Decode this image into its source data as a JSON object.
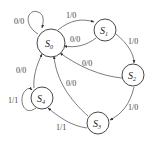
{
  "diagram": {
    "type": "state-machine",
    "states": [
      {
        "id": "S0",
        "name": "S",
        "sub": "0"
      },
      {
        "id": "S1",
        "name": "S",
        "sub": "1"
      },
      {
        "id": "S2",
        "name": "S",
        "sub": "2"
      },
      {
        "id": "S3",
        "name": "S",
        "sub": "3"
      },
      {
        "id": "S4",
        "name": "S",
        "sub": "4"
      }
    ],
    "transitions": [
      {
        "from": "S0",
        "to": "S0",
        "label": "0/0"
      },
      {
        "from": "S0",
        "to": "S1",
        "label": "1/0"
      },
      {
        "from": "S1",
        "to": "S0",
        "label": "0/0"
      },
      {
        "from": "S1",
        "to": "S2",
        "label": "1/0"
      },
      {
        "from": "S2",
        "to": "S0",
        "label": "0/0"
      },
      {
        "from": "S2",
        "to": "S3",
        "label": "1/0"
      },
      {
        "from": "S3",
        "to": "S0",
        "label": "0/0"
      },
      {
        "from": "S3",
        "to": "S4",
        "label": "1/1"
      },
      {
        "from": "S4",
        "to": "S0",
        "label": "0/0"
      },
      {
        "from": "S4",
        "to": "S4",
        "label": "1/1"
      }
    ]
  }
}
